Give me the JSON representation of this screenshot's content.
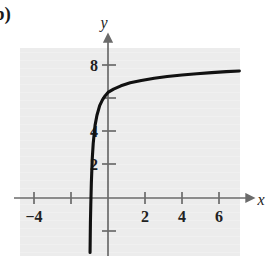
{
  "figure": {
    "part_label": "b)",
    "panel_bg": "#ececec",
    "axis_color": "#6b6b6b",
    "curve_color": "#111111"
  },
  "chart_data": {
    "type": "line",
    "title": "",
    "subtitle": "",
    "xlabel": "x",
    "ylabel": "y",
    "xlim": [
      -5,
      7.6
    ],
    "ylim": [
      -3.4,
      9.2
    ],
    "grid": false,
    "legend": null,
    "x_ticks": [
      -4,
      2,
      4,
      6
    ],
    "x_tick_labels": [
      "−4",
      "2",
      "4",
      "6"
    ],
    "x_ticks_unlabeled": [
      -2
    ],
    "y_ticks": [
      2,
      4,
      8
    ],
    "y_tick_labels": [
      "2",
      "4",
      "8"
    ],
    "y_ticks_unlabeled": [
      6,
      -2
    ],
    "asymptote": {
      "type": "vertical",
      "x": -1
    },
    "series": [
      {
        "name": "curve",
        "x": [
          -0.97,
          -0.96,
          -0.95,
          -0.93,
          -0.9,
          -0.85,
          -0.8,
          -0.7,
          -0.6,
          -0.45,
          -0.3,
          -0.15,
          0,
          0.3,
          0.7,
          1.2,
          1.8,
          2.5,
          3.2,
          4.0,
          4.8,
          5.6,
          6.4,
          7.1
        ],
        "y": [
          -3.3,
          -2.4,
          -1.5,
          -0.4,
          0.9,
          2.4,
          3.3,
          4.4,
          5.0,
          5.6,
          5.95,
          6.2,
          6.4,
          6.6,
          6.8,
          6.98,
          7.12,
          7.26,
          7.36,
          7.45,
          7.53,
          7.6,
          7.66,
          7.7
        ]
      }
    ]
  }
}
